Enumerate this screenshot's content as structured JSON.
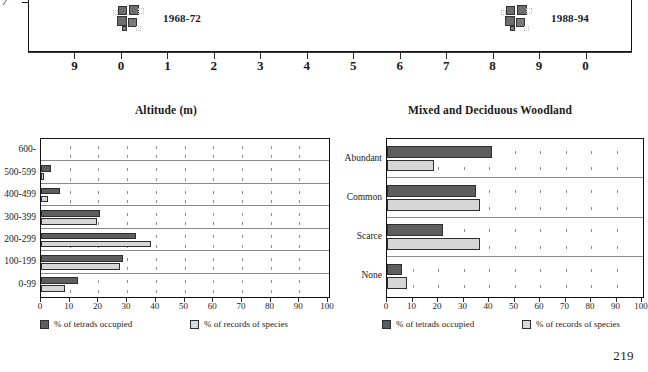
{
  "page": {
    "number": "219"
  },
  "map": {
    "left_axis_label": "7",
    "periods": [
      {
        "label": "1968-72"
      },
      {
        "label": "1988-94"
      }
    ],
    "x_tick_labels": [
      "9",
      "0",
      "1",
      "2",
      "3",
      "4",
      "5",
      "6",
      "7",
      "8",
      "9",
      "0"
    ]
  },
  "colors": {
    "dark_series": "#5d5d5d",
    "light_series": "#d6d6d6",
    "frame": "#111111",
    "gridline": "#8a8a8a"
  },
  "legend": {
    "dark_label": "% of tetrads occupied",
    "light_label": "% of records of species"
  },
  "chart_data": [
    {
      "type": "bar",
      "id": "altitude",
      "title": "Altitude (m)",
      "orientation": "horizontal",
      "xlabel": "",
      "ylabel": "",
      "xlim": [
        0,
        100
      ],
      "xticks": [
        0,
        10,
        20,
        30,
        40,
        50,
        60,
        70,
        80,
        90,
        100
      ],
      "xtick_labels": [
        "0",
        "10",
        "20",
        "30",
        "40",
        "50",
        "60",
        "70",
        "80",
        "90",
        "100"
      ],
      "grid": "dotted-vertical",
      "legend_position": "below",
      "categories": [
        "600-",
        "500-599",
        "400-499",
        "300-399",
        "200-299",
        "100-199",
        "0-99"
      ],
      "series": [
        {
          "name": "% of tetrads occupied",
          "values": [
            0,
            3.5,
            6.5,
            20.5,
            33,
            28.5,
            13
          ]
        },
        {
          "name": "% of records of species",
          "values": [
            0,
            1,
            2.5,
            19.5,
            38.5,
            27.5,
            8.5
          ]
        }
      ]
    },
    {
      "type": "bar",
      "id": "mixed-deciduous-woodland",
      "title": "Mixed and Deciduous Woodland",
      "orientation": "horizontal",
      "xlabel": "",
      "ylabel": "",
      "xlim": [
        0,
        100
      ],
      "xticks": [
        0,
        10,
        20,
        30,
        40,
        50,
        60,
        70,
        80,
        90,
        100
      ],
      "xtick_labels": [
        "0",
        "10",
        "20",
        "30",
        "40",
        "50",
        "60",
        "70",
        "80",
        "90",
        "100"
      ],
      "grid": "dotted-vertical",
      "legend_position": "below",
      "categories": [
        "Abundant",
        "Common",
        "Scarce",
        "None"
      ],
      "series": [
        {
          "name": "% of tetrads occupied",
          "values": [
            41,
            35,
            22,
            6
          ]
        },
        {
          "name": "% of records of species",
          "values": [
            18.5,
            36.5,
            36.5,
            8
          ]
        }
      ]
    }
  ]
}
